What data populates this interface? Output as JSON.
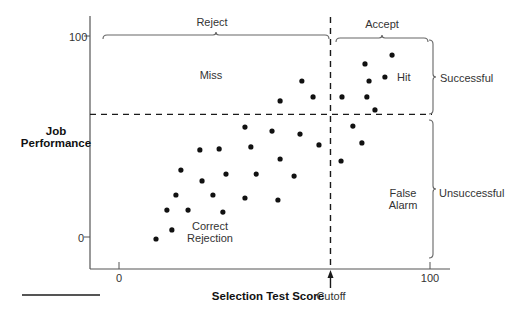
{
  "chart_data": {
    "type": "scatter",
    "title": "",
    "xlabel": "Selection Test Score",
    "ylabel": "Job Performance",
    "xlim": [
      -10,
      106
    ],
    "ylim": [
      -16,
      110
    ],
    "x_ticks": [
      {
        "value": 0,
        "label": "0"
      },
      {
        "value": 100,
        "label": "100"
      }
    ],
    "y_ticks": [
      {
        "value": 0,
        "label": "0"
      },
      {
        "value": 100,
        "label": "100"
      }
    ],
    "cutoff": {
      "x": 68,
      "label": "Cutoff"
    },
    "success_threshold": {
      "y": 61
    },
    "grid": false,
    "legend": null,
    "x_braces": [
      {
        "label": "Reject",
        "from": -5,
        "to": 67
      },
      {
        "label": "Accept",
        "from": 69,
        "to": 99
      }
    ],
    "y_braces": [
      {
        "label": "Successful",
        "from": 61,
        "to": 98
      },
      {
        "label": "Unsuccessful",
        "from": 10,
        "to": 58
      }
    ],
    "quadrant_labels": [
      {
        "label": "Miss",
        "x": 29,
        "y": 81
      },
      {
        "label": "Hit",
        "x": 94,
        "y": 74
      },
      {
        "label": "False Alarm",
        "x": 88,
        "y": 20
      },
      {
        "label": "Correct Rejection",
        "x": 35,
        "y": 3
      }
    ],
    "points": [
      {
        "x": 11.9,
        "y": -1.0
      },
      {
        "x": 17.0,
        "y": 3.5
      },
      {
        "x": 15.4,
        "y": 13.4
      },
      {
        "x": 22.2,
        "y": 13.4
      },
      {
        "x": 33.4,
        "y": 12.4
      },
      {
        "x": 18.3,
        "y": 20.9
      },
      {
        "x": 30.2,
        "y": 20.9
      },
      {
        "x": 40.5,
        "y": 19.4
      },
      {
        "x": 51.1,
        "y": 18.4
      },
      {
        "x": 19.9,
        "y": 33.3
      },
      {
        "x": 26.7,
        "y": 27.9
      },
      {
        "x": 34.4,
        "y": 31.3
      },
      {
        "x": 44.1,
        "y": 31.3
      },
      {
        "x": 56.3,
        "y": 30.3
      },
      {
        "x": 26.0,
        "y": 43.3
      },
      {
        "x": 32.2,
        "y": 43.8
      },
      {
        "x": 42.4,
        "y": 44.8
      },
      {
        "x": 51.8,
        "y": 38.8
      },
      {
        "x": 40.5,
        "y": 54.7
      },
      {
        "x": 49.2,
        "y": 52.7
      },
      {
        "x": 58.2,
        "y": 51.2
      },
      {
        "x": 64.3,
        "y": 45.8
      },
      {
        "x": 51.8,
        "y": 67.7
      },
      {
        "x": 58.8,
        "y": 77.6
      },
      {
        "x": 62.4,
        "y": 69.7
      },
      {
        "x": 71.4,
        "y": 37.8
      },
      {
        "x": 75.2,
        "y": 55.2
      },
      {
        "x": 78.1,
        "y": 46.8
      },
      {
        "x": 71.7,
        "y": 69.7
      },
      {
        "x": 79.7,
        "y": 69.7
      },
      {
        "x": 82.3,
        "y": 63.2
      },
      {
        "x": 80.4,
        "y": 77.6
      },
      {
        "x": 79.1,
        "y": 86.1
      },
      {
        "x": 85.5,
        "y": 79.6
      },
      {
        "x": 87.8,
        "y": 90.5
      }
    ]
  },
  "labels": {
    "reject": "Reject",
    "accept": "Accept",
    "miss": "Miss",
    "hit": "Hit",
    "successful": "Successful",
    "unsuccessful": "Unsuccessful",
    "false_alarm_1": "False",
    "false_alarm_2": "Alarm",
    "correct_rejection_1": "Correct",
    "correct_rejection_2": "Rejection",
    "ylabel_1": "Job",
    "ylabel_2": "Performance",
    "xlabel": "Selection Test Score",
    "cutoff": "Cutoff",
    "y_tick_100": "100",
    "y_tick_0": "0",
    "x_tick_0": "0",
    "x_tick_100": "100"
  },
  "colors": {
    "axis": "#555555",
    "dash": "#1a1a1a",
    "dot": "#111111",
    "brace": "#666666"
  }
}
